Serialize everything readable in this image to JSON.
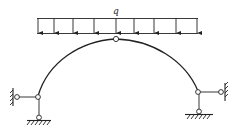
{
  "diagram": {
    "type": "three-hinged arch with link supports",
    "load": {
      "label": "q",
      "kind": "uniformly distributed load",
      "arrow_count": 9
    },
    "colors": {
      "line": "#222222",
      "background": "#ffffff"
    }
  }
}
